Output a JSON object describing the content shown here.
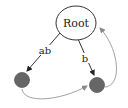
{
  "diagram": {
    "type": "graph",
    "nodes": [
      {
        "id": "root",
        "label": "Root",
        "shape": "ellipse",
        "fill": "#ffffff",
        "stroke": "#333333"
      },
      {
        "id": "n1",
        "label": "",
        "shape": "circle",
        "fill": "#666666",
        "stroke": "#555555"
      },
      {
        "id": "n2",
        "label": "",
        "shape": "circle",
        "fill": "#666666",
        "stroke": "#555555"
      }
    ],
    "edges": [
      {
        "from": "root",
        "to": "n1",
        "label": "ab",
        "color": "#333333"
      },
      {
        "from": "root",
        "to": "n2",
        "label": "b",
        "color": "#333333"
      },
      {
        "from": "n1",
        "to": "n2",
        "label": "",
        "color": "#888888"
      },
      {
        "from": "n2",
        "to": "root",
        "label": "",
        "color": "#888888"
      }
    ]
  },
  "labels": {
    "root": "Root",
    "edge_ab": "ab",
    "edge_b": "b"
  },
  "colors": {
    "node_fill": "#666666",
    "edge_dark": "#333333",
    "edge_light": "#888888",
    "background": "#ffffff"
  }
}
